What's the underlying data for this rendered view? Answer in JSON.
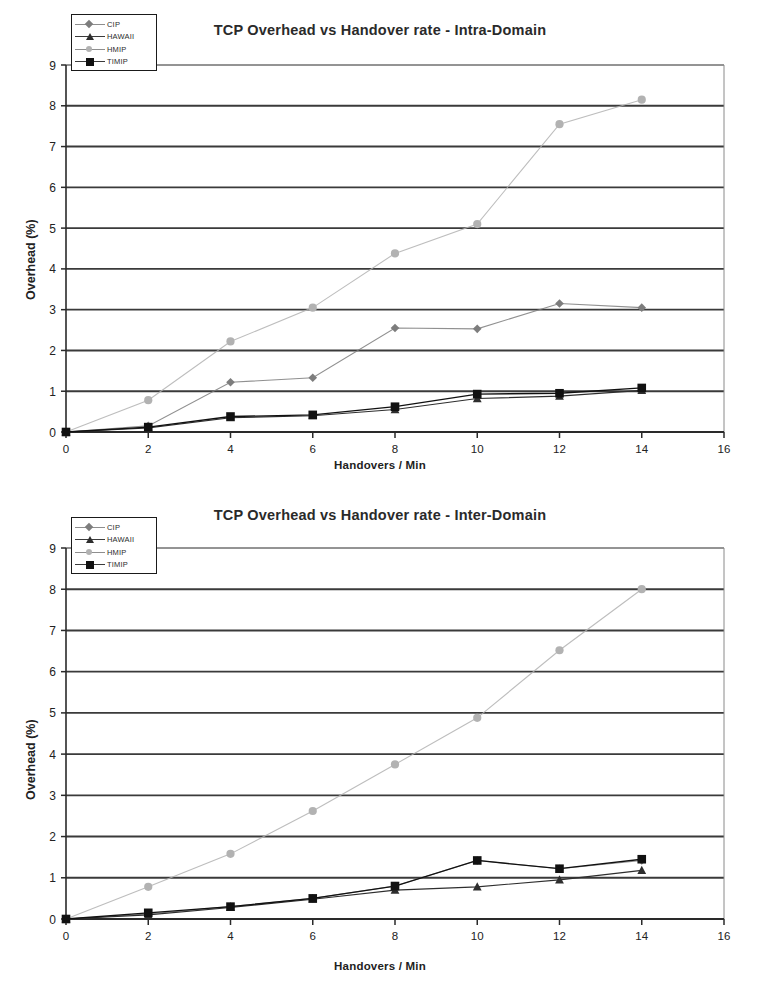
{
  "page": {
    "background": "#ffffff",
    "series_colors": {
      "CIP": "#7d7d7d",
      "HAWAII": "#2e2e2e",
      "HMIP": "#b2b2b2",
      "TIMIP": "#111111"
    }
  },
  "charts": [
    {
      "id": "intra",
      "title": "TCP Overhead vs Handover rate - Intra-Domain",
      "legend": {
        "position": "top-left",
        "entries": [
          {
            "label": "CIP",
            "marker": "diamond",
            "color": "#7d7d7d"
          },
          {
            "label": "HAWAII",
            "marker": "triangle",
            "color": "#2e2e2e"
          },
          {
            "label": "HMIP",
            "marker": "circle",
            "color": "#b2b2b2"
          },
          {
            "label": "TIMIP",
            "marker": "square",
            "color": "#111111"
          }
        ]
      },
      "axes": {
        "x": {
          "label": "Handovers / Min",
          "min": 0,
          "max": 16,
          "step": 2,
          "ticks": [
            "0",
            "2",
            "4",
            "6",
            "8",
            "10",
            "12",
            "14",
            "16"
          ]
        },
        "y": {
          "label": "Overhead (%)",
          "min": 0,
          "max": 9,
          "step": 1,
          "ticks": [
            "0",
            "1",
            "2",
            "3",
            "4",
            "5",
            "6",
            "7",
            "8",
            "9"
          ]
        }
      }
    },
    {
      "id": "inter",
      "title": "TCP Overhead vs Handover rate - Inter-Domain",
      "legend": {
        "position": "top-left",
        "entries": [
          {
            "label": "CIP",
            "marker": "diamond",
            "color": "#7d7d7d"
          },
          {
            "label": "HAWAII",
            "marker": "triangle",
            "color": "#2e2e2e"
          },
          {
            "label": "HMIP",
            "marker": "circle",
            "color": "#b2b2b2"
          },
          {
            "label": "TIMIP",
            "marker": "square",
            "color": "#111111"
          }
        ]
      },
      "axes": {
        "x": {
          "label": "Handovers / Min",
          "min": 0,
          "max": 16,
          "step": 2,
          "ticks": [
            "0",
            "2",
            "4",
            "6",
            "8",
            "10",
            "12",
            "14",
            "16"
          ]
        },
        "y": {
          "label": "Overhead (%)",
          "min": 0,
          "max": 9,
          "step": 1,
          "ticks": [
            "0",
            "1",
            "2",
            "3",
            "4",
            "5",
            "6",
            "7",
            "8",
            "9"
          ]
        }
      }
    }
  ],
  "chart_data": [
    {
      "type": "line",
      "id": "intra",
      "title": "TCP Overhead vs Handover rate - Intra-Domain",
      "xlabel": "Handovers / Min",
      "ylabel": "Overhead (%)",
      "xlim": [
        0,
        16
      ],
      "ylim": [
        0,
        9
      ],
      "xticks": [
        0,
        2,
        4,
        6,
        8,
        10,
        12,
        14,
        16
      ],
      "yticks": [
        0,
        1,
        2,
        3,
        4,
        5,
        6,
        7,
        8,
        9
      ],
      "grid": "horizontal",
      "legend_position": "top-left",
      "x": [
        0,
        2,
        4,
        6,
        8,
        10,
        12,
        14
      ],
      "series": [
        {
          "name": "CIP",
          "marker": "diamond",
          "color": "#7d7d7d",
          "values": [
            0.0,
            0.15,
            1.22,
            1.33,
            2.55,
            2.53,
            3.15,
            3.05
          ]
        },
        {
          "name": "HAWAII",
          "marker": "triangle",
          "color": "#2e2e2e",
          "values": [
            0.0,
            0.1,
            0.35,
            0.4,
            0.55,
            0.82,
            0.88,
            1.02
          ]
        },
        {
          "name": "HMIP",
          "marker": "circle",
          "color": "#b2b2b2",
          "values": [
            0.0,
            0.78,
            2.22,
            3.05,
            4.38,
            5.1,
            7.55,
            8.15
          ]
        },
        {
          "name": "TIMIP",
          "marker": "square",
          "color": "#111111",
          "values": [
            0.0,
            0.12,
            0.38,
            0.42,
            0.62,
            0.93,
            0.95,
            1.08
          ]
        }
      ]
    },
    {
      "type": "line",
      "id": "inter",
      "title": "TCP Overhead vs Handover rate - Inter-Domain",
      "xlabel": "Handovers / Min",
      "ylabel": "Overhead (%)",
      "xlim": [
        0,
        16
      ],
      "ylim": [
        0,
        9
      ],
      "xticks": [
        0,
        2,
        4,
        6,
        8,
        10,
        12,
        14,
        16
      ],
      "yticks": [
        0,
        1,
        2,
        3,
        4,
        5,
        6,
        7,
        8,
        9
      ],
      "grid": "horizontal",
      "legend_position": "top-left",
      "x": [
        0,
        2,
        4,
        6,
        8,
        10,
        12,
        14
      ],
      "series": [
        {
          "name": "CIP",
          "marker": "diamond",
          "color": "#7d7d7d",
          "values": [
            0.0,
            0.12,
            0.3,
            0.5,
            0.8,
            1.42,
            1.22,
            1.42
          ]
        },
        {
          "name": "HAWAII",
          "marker": "triangle",
          "color": "#2e2e2e",
          "values": [
            0.0,
            0.1,
            0.28,
            0.48,
            0.7,
            0.78,
            0.95,
            1.18
          ]
        },
        {
          "name": "HMIP",
          "marker": "circle",
          "color": "#b2b2b2",
          "values": [
            0.0,
            0.78,
            1.58,
            2.62,
            3.75,
            4.88,
            6.52,
            8.0
          ]
        },
        {
          "name": "TIMIP",
          "marker": "square",
          "color": "#111111",
          "values": [
            0.0,
            0.15,
            0.3,
            0.5,
            0.8,
            1.42,
            1.22,
            1.45
          ]
        }
      ]
    }
  ]
}
